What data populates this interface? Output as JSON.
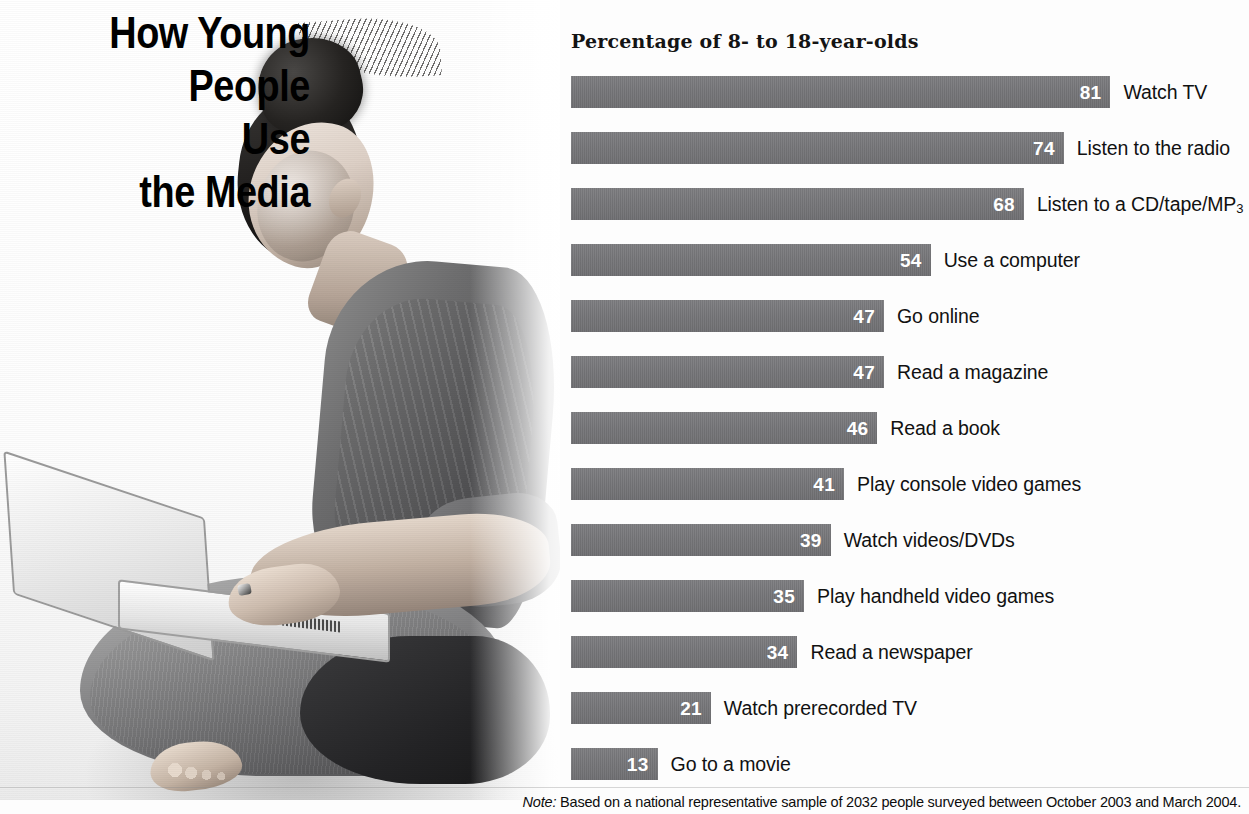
{
  "title": {
    "lines": [
      "How Young",
      "People",
      "Use",
      "the Media"
    ]
  },
  "chart_heading": "Percentage of 8- to 18-year-olds",
  "note": {
    "prefix": "Note:",
    "text": " Based on a national representative sample of 2032 people surveyed between October 2003 and March 2004."
  },
  "photo": {
    "alt": "grayscale photo of a young woman sitting cross-legged on the floor using a laptop"
  },
  "colors": {
    "bar": "#76767a",
    "bar_value_text": "#ffffff",
    "label_text": "#111111",
    "background": "#ffffff"
  },
  "chart_data": {
    "type": "bar",
    "orientation": "horizontal",
    "title": "Percentage of 8- to 18-year-olds",
    "xlabel": "",
    "ylabel": "",
    "xlim": [
      0,
      81
    ],
    "grid": false,
    "legend": null,
    "value_suffix": "",
    "categories": [
      "Watch TV",
      "Listen to the radio",
      "Listen to a CD/tape/MP3",
      "Use a computer",
      "Go online",
      "Read a magazine",
      "Read a book",
      "Play console video games",
      "Watch videos/DVDs",
      "Play handheld video games",
      "Read a newspaper",
      "Watch prerecorded TV",
      "Go to a movie"
    ],
    "values": [
      81,
      74,
      68,
      54,
      47,
      47,
      46,
      41,
      39,
      35,
      34,
      21,
      13
    ],
    "bars": [
      {
        "label": "Watch TV",
        "label_main": "Watch TV",
        "label_sub": "",
        "value": 81
      },
      {
        "label": "Listen to the radio",
        "label_main": "Listen to the radio",
        "label_sub": "",
        "value": 74
      },
      {
        "label": "Listen to a CD/tape/MP3",
        "label_main": "Listen to a CD/tape/MP",
        "label_sub": "3",
        "value": 68
      },
      {
        "label": "Use a computer",
        "label_main": "Use a computer",
        "label_sub": "",
        "value": 54
      },
      {
        "label": "Go online",
        "label_main": "Go online",
        "label_sub": "",
        "value": 47
      },
      {
        "label": "Read a magazine",
        "label_main": "Read a magazine",
        "label_sub": "",
        "value": 47
      },
      {
        "label": "Read a book",
        "label_main": "Read a book",
        "label_sub": "",
        "value": 46
      },
      {
        "label": "Play console video games",
        "label_main": "Play console video games",
        "label_sub": "",
        "value": 41
      },
      {
        "label": "Watch videos/DVDs",
        "label_main": "Watch videos/DVDs",
        "label_sub": "",
        "value": 39
      },
      {
        "label": "Play handheld video games",
        "label_main": "Play handheld video games",
        "label_sub": "",
        "value": 35
      },
      {
        "label": "Read a newspaper",
        "label_main": "Read a newspaper",
        "label_sub": "",
        "value": 34
      },
      {
        "label": "Watch prerecorded TV",
        "label_main": "Watch prerecorded TV",
        "label_sub": "",
        "value": 21
      },
      {
        "label": "Go to a movie",
        "label_main": "Go to a movie",
        "label_sub": "",
        "value": 13
      }
    ]
  }
}
